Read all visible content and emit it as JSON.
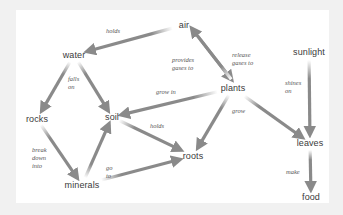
{
  "diagram": {
    "type": "concept-map",
    "colors": {
      "background": "#f1f1f1",
      "panel": "#ffffff",
      "arrow": "#8a8a8a",
      "node_text": "#3a3a3a",
      "label_text": "#555555"
    },
    "nodes": [
      {
        "id": "air",
        "label": "air",
        "x": 184,
        "y": 25
      },
      {
        "id": "water",
        "label": "water",
        "x": 74,
        "y": 55
      },
      {
        "id": "sunlight",
        "label": "sunlight",
        "x": 309,
        "y": 52
      },
      {
        "id": "plants",
        "label": "plants",
        "x": 233,
        "y": 88
      },
      {
        "id": "rocks",
        "label": "rocks",
        "x": 37,
        "y": 119
      },
      {
        "id": "soil",
        "label": "soil",
        "x": 112,
        "y": 117
      },
      {
        "id": "leaves",
        "label": "leaves",
        "x": 310,
        "y": 143
      },
      {
        "id": "roots",
        "label": "roots",
        "x": 193,
        "y": 156
      },
      {
        "id": "minerals",
        "label": "minerals",
        "x": 82,
        "y": 185
      },
      {
        "id": "food",
        "label": "food",
        "x": 311,
        "y": 197
      }
    ],
    "edges": [
      {
        "from": "air",
        "to": "water",
        "label": "holds"
      },
      {
        "from": "water",
        "to": "rocks",
        "label": "falls on"
      },
      {
        "from": "water",
        "to": "soil",
        "label": ""
      },
      {
        "from": "air",
        "to": "plants",
        "label": "provides gases to"
      },
      {
        "from": "plants",
        "to": "air",
        "label": "release gases to"
      },
      {
        "from": "plants",
        "to": "soil",
        "label": "grow in"
      },
      {
        "from": "plants",
        "to": "roots",
        "label": "grow"
      },
      {
        "from": "plants",
        "to": "leaves",
        "label": ""
      },
      {
        "from": "sunlight",
        "to": "leaves",
        "label": "shines on"
      },
      {
        "from": "soil",
        "to": "roots",
        "label": "holds"
      },
      {
        "from": "rocks",
        "to": "minerals",
        "label": "break down into"
      },
      {
        "from": "minerals",
        "to": "soil",
        "label": "go to"
      },
      {
        "from": "minerals",
        "to": "roots",
        "label": ""
      },
      {
        "from": "leaves",
        "to": "food",
        "label": "make"
      }
    ],
    "edge_labels": {
      "holds_air_water": "holds",
      "falls_on": "falls\non",
      "provides": "provides\ngases to",
      "release": "release\ngases to",
      "grow_in": "grow in",
      "grow": "grow",
      "shines_on": "shines\non",
      "holds_soil_roots": "holds",
      "break_down": "break\ndown\ninto",
      "go_to": "go\nto",
      "make": "make"
    }
  }
}
